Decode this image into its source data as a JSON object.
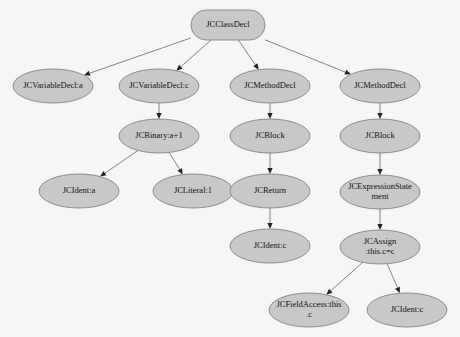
{
  "diagram": {
    "type": "tree",
    "colors": {
      "node_fill": "#c8c8c8",
      "node_stroke": "#777777",
      "edge": "#666666",
      "background": "#f6f6f4"
    },
    "nodes": [
      {
        "id": "n0",
        "label": "JCClassDecl",
        "shape": "rounded-rect",
        "cx": 228,
        "cy": 25,
        "w": 74,
        "h": 30
      },
      {
        "id": "n1",
        "label": "JCVariableDecl:a",
        "shape": "ellipse",
        "cx": 53,
        "cy": 86,
        "rx": 40,
        "ry": 17
      },
      {
        "id": "n2",
        "label": "JCVariableDecl:c",
        "shape": "ellipse",
        "cx": 159,
        "cy": 86,
        "rx": 40,
        "ry": 17
      },
      {
        "id": "n3",
        "label": "JCMethodDecl",
        "shape": "ellipse",
        "cx": 270,
        "cy": 86,
        "rx": 40,
        "ry": 17
      },
      {
        "id": "n4",
        "label": "JCMethodDecl",
        "shape": "ellipse",
        "cx": 380,
        "cy": 86,
        "rx": 40,
        "ry": 17
      },
      {
        "id": "n5",
        "label": "JCBinary:a+1",
        "shape": "ellipse",
        "cx": 159,
        "cy": 136,
        "rx": 40,
        "ry": 17
      },
      {
        "id": "n6",
        "label": "JCBlock",
        "shape": "ellipse",
        "cx": 270,
        "cy": 136,
        "rx": 40,
        "ry": 17
      },
      {
        "id": "n7",
        "label": "JCBlock",
        "shape": "ellipse",
        "cx": 380,
        "cy": 136,
        "rx": 40,
        "ry": 17
      },
      {
        "id": "n8",
        "label": "JCIdent:a",
        "shape": "ellipse",
        "cx": 79,
        "cy": 191,
        "rx": 40,
        "ry": 17
      },
      {
        "id": "n9",
        "label": "JCLiteral:1",
        "shape": "ellipse",
        "cx": 193,
        "cy": 191,
        "rx": 40,
        "ry": 17
      },
      {
        "id": "n10",
        "label": "JCReturn",
        "shape": "ellipse",
        "cx": 270,
        "cy": 191,
        "rx": 40,
        "ry": 17
      },
      {
        "id": "n11",
        "label": "JCExpressionState",
        "label2": "ment",
        "shape": "ellipse",
        "cx": 380,
        "cy": 192,
        "rx": 40,
        "ry": 17
      },
      {
        "id": "n12",
        "label": "JCIdent:c",
        "shape": "ellipse",
        "cx": 270,
        "cy": 246,
        "rx": 40,
        "ry": 17
      },
      {
        "id": "n13",
        "label": "JCAssign",
        "label2": ":this.c=c",
        "shape": "ellipse",
        "cx": 380,
        "cy": 247,
        "rx": 40,
        "ry": 17
      },
      {
        "id": "n14",
        "label": "JCFieldAccess:this",
        "label2": ".c",
        "shape": "ellipse",
        "cx": 309,
        "cy": 310,
        "rx": 40,
        "ry": 17
      },
      {
        "id": "n15",
        "label": "JCIdent:c",
        "shape": "ellipse",
        "cx": 407,
        "cy": 310,
        "rx": 40,
        "ry": 17
      }
    ],
    "edges": [
      {
        "from": "n0",
        "to": "n1"
      },
      {
        "from": "n0",
        "to": "n2"
      },
      {
        "from": "n0",
        "to": "n3"
      },
      {
        "from": "n0",
        "to": "n4"
      },
      {
        "from": "n2",
        "to": "n5"
      },
      {
        "from": "n3",
        "to": "n6"
      },
      {
        "from": "n4",
        "to": "n7"
      },
      {
        "from": "n5",
        "to": "n8"
      },
      {
        "from": "n5",
        "to": "n9"
      },
      {
        "from": "n6",
        "to": "n10"
      },
      {
        "from": "n7",
        "to": "n11"
      },
      {
        "from": "n10",
        "to": "n12"
      },
      {
        "from": "n11",
        "to": "n13"
      },
      {
        "from": "n13",
        "to": "n14"
      },
      {
        "from": "n13",
        "to": "n15"
      }
    ]
  }
}
